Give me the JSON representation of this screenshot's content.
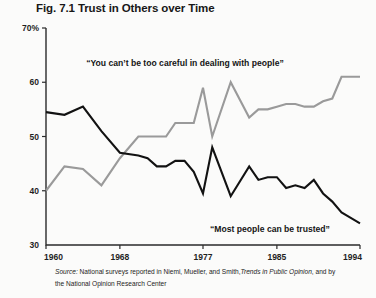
{
  "figure": {
    "title": "Fig. 7.1 Trust in Others over Time",
    "source_label": "Source:",
    "source_text_a": "National surveys reported in Niemi, Mueller, and Smith,",
    "source_work": "Trends in Public Opinion",
    "source_text_b": ", and by",
    "source_line2": "the National Opinion Research Center"
  },
  "chart_data": {
    "type": "line",
    "title": "Fig. 7.1 Trust in Others over Time",
    "xlabel": "",
    "ylabel": "",
    "xlim": [
      1960,
      1994
    ],
    "ylim": [
      30,
      70
    ],
    "grid": false,
    "legend": "annotations-inline",
    "xticks": [
      "1960",
      "1968",
      "1977",
      "1985",
      "1994"
    ],
    "xtick_values": [
      1960,
      1968,
      1977,
      1985,
      1994
    ],
    "yticks": [
      "70%",
      "60",
      "50",
      "40",
      "30"
    ],
    "ytick_values": [
      70,
      60,
      50,
      40,
      30
    ],
    "annotations": [
      {
        "text": "“You can’t be too careful in dealing with people”",
        "x": 185,
        "y": 66,
        "anchor": "middle",
        "series": "too-careful"
      },
      {
        "text": "“Most people can be trusted”",
        "x": 270,
        "y": 232,
        "anchor": "middle",
        "series": "can-be-trusted"
      }
    ],
    "series": [
      {
        "name": "You can't be too careful in dealing with people",
        "color": "#9a9a9a",
        "x": [
          1960,
          1962,
          1964,
          1966,
          1968,
          1970,
          1971,
          1972,
          1973,
          1974,
          1975,
          1976,
          1977,
          1978,
          1980,
          1982,
          1983,
          1984,
          1985,
          1986,
          1987,
          1988,
          1989,
          1990,
          1991,
          1992,
          1993,
          1994
        ],
        "values": [
          40.0,
          44.5,
          44.0,
          41.0,
          46.0,
          50.0,
          50.0,
          50.0,
          50.0,
          52.5,
          52.5,
          52.5,
          59.0,
          50.0,
          60.0,
          53.5,
          55.0,
          55.0,
          55.5,
          56.0,
          56.0,
          55.5,
          55.5,
          56.5,
          57.0,
          61.0,
          61.0,
          61.0
        ]
      },
      {
        "name": "Most people can be trusted",
        "color": "#121212",
        "x": [
          1960,
          1962,
          1964,
          1966,
          1968,
          1970,
          1971,
          1972,
          1973,
          1974,
          1975,
          1976,
          1977,
          1978,
          1980,
          1982,
          1983,
          1984,
          1985,
          1986,
          1987,
          1988,
          1989,
          1990,
          1991,
          1992,
          1993,
          1994
        ],
        "values": [
          54.5,
          54.0,
          55.5,
          51.0,
          47.0,
          46.5,
          46.0,
          44.5,
          44.5,
          45.5,
          45.5,
          43.5,
          39.5,
          48.0,
          39.0,
          44.5,
          42.0,
          42.5,
          42.5,
          40.5,
          41.0,
          40.5,
          42.0,
          39.5,
          38.0,
          36.0,
          35.0,
          34.0
        ]
      }
    ],
    "geometry": {
      "plot_left": 46,
      "plot_right": 360,
      "plot_top": 28,
      "plot_bottom": 245
    }
  }
}
